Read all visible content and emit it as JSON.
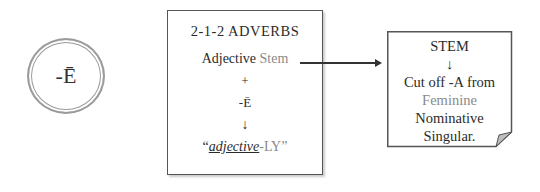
{
  "circle": {
    "label": "-Ē"
  },
  "main_box": {
    "title": "2-1-2 ADVERBS",
    "line1_a": "Adjective",
    "line1_b": "Stem",
    "plus": "+",
    "ending": "-Ē",
    "arrow": "↓",
    "result_open": "“",
    "result_italic": "adjective",
    "result_rest": "-LY”"
  },
  "note": {
    "title": "STEM",
    "arrow": "↓",
    "line1": "Cut off -A from",
    "line2": "Feminine",
    "line3": "Nominative",
    "line4": "Singular."
  },
  "colors": {
    "text": "#2b2b2b",
    "highlight_gray": "#8a8a8a",
    "border": "#555555"
  }
}
